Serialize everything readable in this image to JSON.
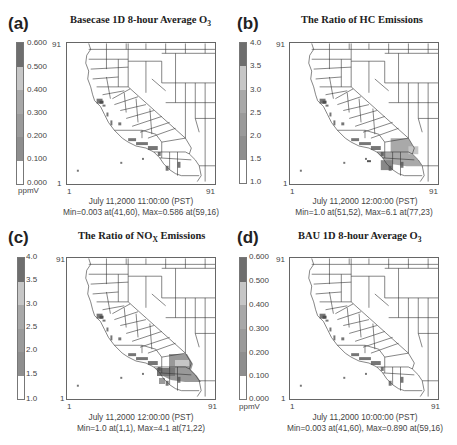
{
  "figure": {
    "panels": [
      {
        "id": "a",
        "label": "(a)",
        "title_main": "Basecase 1D 8-hour Average O",
        "title_sub": "3",
        "title_suffix": "",
        "colorbar": {
          "ticks": [
            "0.600",
            "0.500",
            "0.400",
            "0.300",
            "0.200",
            "0.100",
            "0.000"
          ],
          "unit": "ppmV",
          "colors": [
            "#6e6e6e",
            "#c4c4c4",
            "#a6a6a6",
            "#989898",
            "#8e8e8e",
            "#ffffff"
          ]
        },
        "axes": {
          "y_top": "91",
          "y_bottom": "1",
          "x_left": "1",
          "x_right": "91"
        },
        "timestamp": "July 11,2000 11:00:00 (PST)",
        "minmax": "Min=0.003 at(41,60), Max=0.586 at(59,16)"
      },
      {
        "id": "b",
        "label": "(b)",
        "title_main": "The Ratio of HC Emissions",
        "title_sub": "",
        "title_suffix": "",
        "colorbar": {
          "ticks": [
            "4.0",
            "3.5",
            "3.0",
            "2.5",
            "2.0",
            "1.5",
            "1.0"
          ],
          "unit": "",
          "colors": [
            "#6e6e6e",
            "#c4c4c4",
            "#a6a6a6",
            "#989898",
            "#8e8e8e",
            "#ffffff"
          ]
        },
        "axes": {
          "y_top": "91",
          "y_bottom": "1",
          "x_left": "1",
          "x_right": "91"
        },
        "timestamp": "July 11,2000 12:00:00 (PST)",
        "minmax": "Min=1.0 at(51,52), Max=6.1 at(77,23)"
      },
      {
        "id": "c",
        "label": "(c)",
        "title_main": "The Ratio of NO",
        "title_sub": "X",
        "title_suffix": " Emissions",
        "colorbar": {
          "ticks": [
            "4.0",
            "3.5",
            "3.0",
            "2.5",
            "2.0",
            "1.5",
            "1.0"
          ],
          "unit": "",
          "colors": [
            "#6e6e6e",
            "#c4c4c4",
            "#a6a6a6",
            "#989898",
            "#8e8e8e",
            "#ffffff"
          ]
        },
        "axes": {
          "y_top": "91",
          "y_bottom": "1",
          "x_left": "1",
          "x_right": "91"
        },
        "timestamp": "July 11,2000 12:00:00 (PST)",
        "minmax": "Min=1.0 at(1,1), Max=4.1 at(71,22)"
      },
      {
        "id": "d",
        "label": "(d)",
        "title_main": "BAU 1D 8-hour Average O",
        "title_sub": "3",
        "title_suffix": "",
        "colorbar": {
          "ticks": [
            "0.600",
            "0.500",
            "0.400",
            "0.300",
            "0.200",
            "0.100",
            "0.000"
          ],
          "unit": "ppmV",
          "colors": [
            "#6e6e6e",
            "#c4c4c4",
            "#a6a6a6",
            "#989898",
            "#8e8e8e",
            "#ffffff"
          ]
        },
        "axes": {
          "y_top": "91",
          "y_bottom": "1",
          "x_left": "1",
          "x_right": "91"
        },
        "timestamp": "July 11,2000 10:00:00 (PST)",
        "minmax": "Min=0.003 at(41,60), Max=0.890 at(59,16)"
      }
    ]
  }
}
